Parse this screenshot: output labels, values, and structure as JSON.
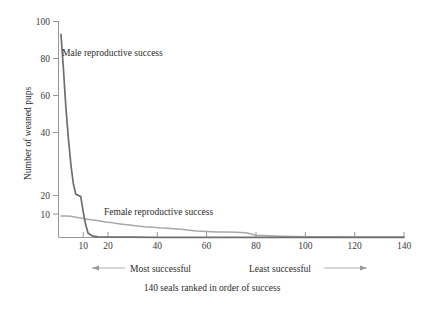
{
  "chart_data": {
    "type": "line",
    "title": "",
    "subtitle": "",
    "xlabel": "140 seals ranked in order of success",
    "ylabel": "Number of weaned pups",
    "xlim": [
      0,
      140
    ],
    "ylim": [
      0,
      100
    ],
    "grid": false,
    "legend_position": "inline-annotations",
    "x_ticks": [
      10,
      20,
      40,
      60,
      80,
      100,
      120,
      140
    ],
    "x_tick_labels": [
      "10",
      "20",
      "40",
      "60",
      "80",
      "100",
      "120",
      "140"
    ],
    "y_ticks": [
      10,
      20,
      40,
      60,
      80,
      100
    ],
    "y_tick_labels": [
      "10",
      "20",
      "40",
      "60",
      "80",
      "100"
    ],
    "series": [
      {
        "name": "Male reproductive success",
        "color": "#6e6e6e",
        "label_x": 12,
        "label_y": 86,
        "x": [
          1,
          2,
          3,
          4,
          5,
          6,
          7,
          8,
          9,
          10,
          11,
          12,
          14,
          16,
          20,
          30,
          40,
          50,
          60,
          70,
          80,
          90,
          100,
          110,
          120,
          130,
          140
        ],
        "values": [
          94,
          78,
          60,
          46,
          34,
          25,
          20,
          19.5,
          19,
          12,
          6,
          2,
          0.6,
          0.3,
          0.2,
          0.15,
          0.1,
          0.1,
          0.1,
          0.1,
          0.1,
          0.1,
          0.1,
          0.1,
          0.1,
          0.1,
          0.1
        ]
      },
      {
        "name": "Female reproductive success",
        "color": "#a8a8a8",
        "label_x": 34,
        "label_y": 11.5,
        "x": [
          1,
          3,
          5,
          7,
          9,
          11,
          13,
          15,
          17,
          19,
          21,
          23,
          25,
          27,
          29,
          31,
          33,
          35,
          38,
          41,
          44,
          47,
          50,
          53,
          56,
          60,
          64,
          68,
          72,
          76,
          80,
          90,
          100,
          110,
          120,
          130,
          140
        ],
        "values": [
          10,
          10,
          9.8,
          9.4,
          9.0,
          8.6,
          8.2,
          8.0,
          7.6,
          7.2,
          7.0,
          6.6,
          6.3,
          6.0,
          5.8,
          5.4,
          5.2,
          5.0,
          4.8,
          4.5,
          4.3,
          4.1,
          3.8,
          3.4,
          3.0,
          2.8,
          2.6,
          2.5,
          2.4,
          2.2,
          1.0,
          0.6,
          0.4,
          0.3,
          0.25,
          0.2,
          0.2
        ]
      }
    ],
    "annotations": [
      {
        "id": "male-label",
        "text": "Male reproductive success"
      },
      {
        "id": "female-label",
        "text": "Female reproductive success"
      },
      {
        "id": "most-successful",
        "text": "Most successful"
      },
      {
        "id": "least-successful",
        "text": "Least successful"
      }
    ]
  },
  "axes": {
    "y_title": "Number of weaned pups",
    "x_caption": "140 seals ranked in order of success"
  },
  "direction_guides": {
    "left_label": "Most successful",
    "right_label": "Least successful"
  },
  "colors": {
    "male_line": "#6e6e6e",
    "female_line": "#a8a8a8",
    "axis": "#8a8a8a",
    "text": "#2b2b2b",
    "background": "#ffffff"
  }
}
